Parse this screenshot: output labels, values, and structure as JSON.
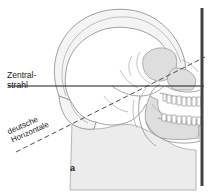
{
  "figure": {
    "panel_letter": "a",
    "background_color": "#ffffff",
    "width": 219,
    "height": 192
  },
  "labels": {
    "central_ray": {
      "line1": "Zentral-",
      "line2": "strahl",
      "full": "Zentralstrahl",
      "color": "#1a1a1a"
    },
    "frankfort_plane": {
      "line1": "deutsche",
      "line2": "Horizontale",
      "full": "deutsche Horizontale",
      "color": "#1a1a1a"
    }
  },
  "graphics": {
    "central_ray_line": {
      "name": "Zentralstrahl",
      "style": "solid",
      "color": "#1a1a1a",
      "y": 86,
      "x_start": 8,
      "x_end": 204
    },
    "frankfort_horizontal_line": {
      "name": "deutsche Horizontale",
      "style": "dashed",
      "color": "#3a3a3a",
      "x_start": 16,
      "y_start": 152,
      "x_end": 205,
      "y_end": 57
    },
    "film_plane": {
      "name": "film-detector-plane",
      "style": "solid-thick-vertical",
      "color": "#434343",
      "x": 202,
      "y_start": 8,
      "y_end": 186
    },
    "skull": {
      "outline_color": "#8c8c8c",
      "fill_color": "#f2f2f2",
      "shade_color": "#d9d9d9",
      "teeth_fill": "#ffffff"
    }
  }
}
